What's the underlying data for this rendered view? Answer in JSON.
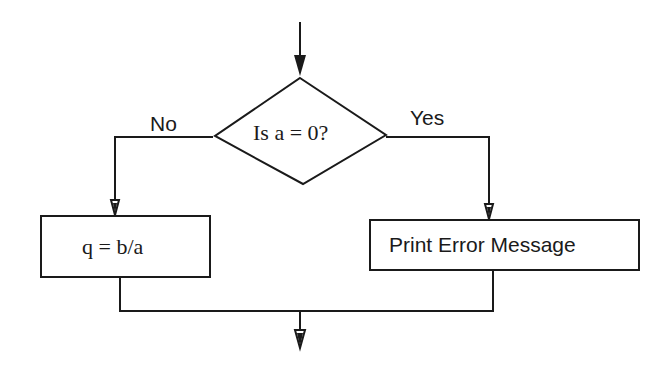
{
  "diagram": {
    "type": "flowchart",
    "decision": {
      "label": "Is a = 0?"
    },
    "branches": {
      "no_label": "No",
      "yes_label": "Yes"
    },
    "process_no": {
      "label": "q = b/a"
    },
    "process_yes": {
      "label": "Print Error Message"
    },
    "colors": {
      "stroke": "#1a1a1a",
      "background": "#ffffff"
    }
  }
}
